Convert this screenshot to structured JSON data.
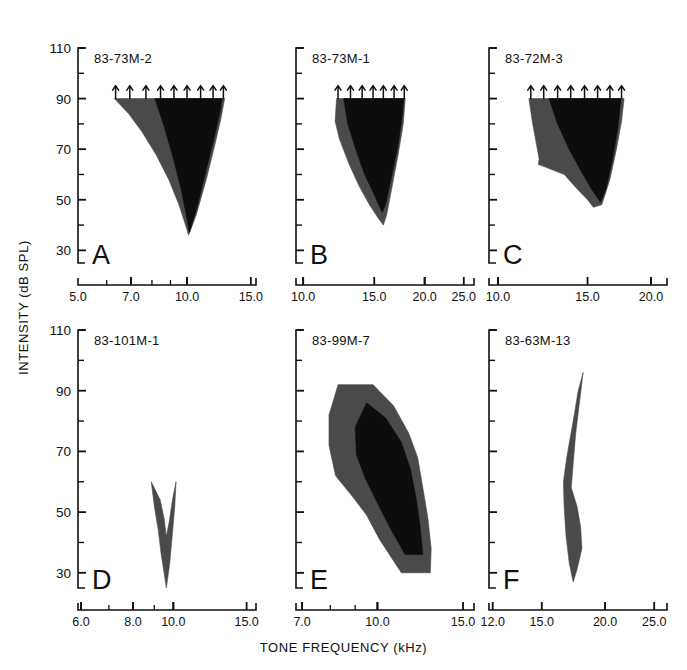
{
  "figure": {
    "axis_titles": {
      "y": "INTENSITY (dB SPL)",
      "x": "TONE FREQUENCY (kHz)"
    },
    "y_tick_labels": [
      "110",
      "90",
      "70",
      "50",
      "30"
    ],
    "y_tick_values": [
      110,
      90,
      70,
      50,
      30
    ],
    "ylim": [
      25,
      110
    ],
    "fill_colors": {
      "outer": "#4a4a4a",
      "inner": "#0d0d0d",
      "axis": "#101010"
    }
  },
  "chart_data": {
    "type": "area",
    "title": "",
    "xlabel": "TONE FREQUENCY (kHz)",
    "ylabel": "INTENSITY (dB SPL)",
    "xscale": "log",
    "ylim": [
      25,
      110
    ],
    "grid": false,
    "legend": "none",
    "panels": [
      {
        "letter": "A",
        "unit_id": "83-73M-2",
        "show_y_labels": true,
        "xlim": [
          5.0,
          15.5
        ],
        "x_tick_labels": [
          "5.0",
          "7.0",
          "10.0",
          "15.0"
        ],
        "x_tick_values": [
          5.0,
          7.0,
          10.0,
          15.0
        ],
        "arrows": {
          "level": 90,
          "frequencies": [
            6.35,
            6.95,
            7.7,
            8.45,
            9.2,
            10.0,
            10.9,
            11.8,
            12.6
          ]
        },
        "outer_curve": [
          [
            6.3,
            90
          ],
          [
            6.9,
            84
          ],
          [
            7.5,
            77
          ],
          [
            8.2,
            68
          ],
          [
            8.9,
            58
          ],
          [
            9.5,
            48
          ],
          [
            9.9,
            40
          ],
          [
            10.1,
            36
          ],
          [
            10.6,
            44
          ],
          [
            11.3,
            58
          ],
          [
            11.9,
            71
          ],
          [
            12.4,
            82
          ],
          [
            12.7,
            90
          ]
        ],
        "inner_curve": [
          [
            8.15,
            90
          ],
          [
            8.6,
            80
          ],
          [
            9.1,
            68
          ],
          [
            9.6,
            55
          ],
          [
            9.95,
            44
          ],
          [
            10.15,
            37
          ],
          [
            10.7,
            48
          ],
          [
            11.3,
            62
          ],
          [
            11.9,
            75
          ],
          [
            12.35,
            85
          ],
          [
            12.5,
            90
          ]
        ]
      },
      {
        "letter": "B",
        "unit_id": "83-73M-1",
        "show_y_labels": false,
        "xlim": [
          9.6,
          26.5
        ],
        "x_tick_labels": [
          "10.0",
          "15.0",
          "20.0",
          "25.0"
        ],
        "x_tick_values": [
          10.0,
          15.0,
          20.0,
          25.0
        ],
        "arrows": {
          "level": 90,
          "frequencies": [
            12.2,
            13.1,
            14.0,
            14.9,
            15.8,
            16.8,
            17.8
          ]
        },
        "outer_curve": [
          [
            12.1,
            90
          ],
          [
            12.0,
            81
          ],
          [
            12.3,
            74
          ],
          [
            13.0,
            64
          ],
          [
            13.8,
            55
          ],
          [
            14.6,
            48
          ],
          [
            15.3,
            43
          ],
          [
            15.8,
            40
          ],
          [
            16.1,
            44
          ],
          [
            16.6,
            55
          ],
          [
            17.2,
            68
          ],
          [
            17.7,
            80
          ],
          [
            17.9,
            90
          ]
        ],
        "inner_curve": [
          [
            12.6,
            90
          ],
          [
            12.9,
            80
          ],
          [
            13.5,
            70
          ],
          [
            14.2,
            60
          ],
          [
            15.0,
            52
          ],
          [
            15.7,
            45
          ],
          [
            16.0,
            48
          ],
          [
            16.6,
            60
          ],
          [
            17.2,
            72
          ],
          [
            17.6,
            83
          ],
          [
            17.75,
            90
          ]
        ]
      },
      {
        "letter": "C",
        "unit_id": "83-72M-3",
        "show_y_labels": false,
        "xlim": [
          9.6,
          21.5
        ],
        "x_tick_labels": [
          "10.0",
          "15.0",
          "20.0"
        ],
        "x_tick_values": [
          10.0,
          15.0,
          20.0
        ],
        "arrows": {
          "level": 90,
          "frequencies": [
            11.6,
            12.3,
            13.1,
            13.9,
            14.8,
            15.7,
            16.6,
            17.5
          ]
        },
        "outer_curve": [
          [
            11.5,
            90
          ],
          [
            11.7,
            80
          ],
          [
            11.9,
            72
          ],
          [
            12.05,
            66
          ],
          [
            12.0,
            64
          ],
          [
            13.5,
            60
          ],
          [
            14.2,
            55
          ],
          [
            15.0,
            50
          ],
          [
            15.4,
            47
          ],
          [
            16.0,
            48
          ],
          [
            16.6,
            58
          ],
          [
            17.1,
            70
          ],
          [
            17.5,
            81
          ],
          [
            17.7,
            90
          ]
        ],
        "inner_curve": [
          [
            12.6,
            90
          ],
          [
            13.1,
            80
          ],
          [
            13.8,
            70
          ],
          [
            14.6,
            61
          ],
          [
            15.3,
            54
          ],
          [
            15.9,
            49
          ],
          [
            16.3,
            54
          ],
          [
            16.8,
            66
          ],
          [
            17.2,
            78
          ],
          [
            17.45,
            90
          ]
        ]
      },
      {
        "letter": "D",
        "unit_id": "83-101M-1",
        "show_y_labels": true,
        "xlim": [
          5.9,
          15.8
        ],
        "x_tick_labels": [
          "6.0",
          "8.0",
          "10.0",
          "15.0"
        ],
        "x_tick_values": [
          6.0,
          8.0,
          10.0,
          15.0
        ],
        "arrows": null,
        "outer_curve": [
          [
            8.85,
            60
          ],
          [
            9.0,
            52
          ],
          [
            9.2,
            44
          ],
          [
            9.35,
            36
          ],
          [
            9.5,
            30
          ],
          [
            9.62,
            25
          ],
          [
            9.8,
            33
          ],
          [
            9.95,
            43
          ],
          [
            10.08,
            52
          ],
          [
            10.15,
            60
          ],
          [
            9.95,
            54
          ],
          [
            9.78,
            47
          ],
          [
            9.62,
            42
          ],
          [
            9.5,
            48
          ],
          [
            9.3,
            54
          ]
        ],
        "inner_curve": null
      },
      {
        "letter": "E",
        "unit_id": "83-99M-7",
        "show_y_labels": false,
        "xlim": [
          6.8,
          15.8
        ],
        "x_tick_labels": [
          "7.0",
          "10.0",
          "15.0"
        ],
        "x_tick_values": [
          7.0,
          10.0,
          15.0
        ],
        "arrows": null,
        "outer_curve": [
          [
            8.3,
            92
          ],
          [
            9.8,
            92
          ],
          [
            10.8,
            85
          ],
          [
            11.6,
            76
          ],
          [
            12.1,
            68
          ],
          [
            12.4,
            58
          ],
          [
            12.7,
            48
          ],
          [
            12.9,
            38
          ],
          [
            12.85,
            30
          ],
          [
            11.2,
            30
          ],
          [
            10.1,
            41
          ],
          [
            9.5,
            49
          ],
          [
            8.9,
            55
          ],
          [
            8.2,
            62
          ],
          [
            7.95,
            72
          ],
          [
            7.95,
            82
          ]
        ],
        "inner_curve": [
          [
            9.5,
            86
          ],
          [
            10.4,
            81
          ],
          [
            11.2,
            73
          ],
          [
            11.7,
            64
          ],
          [
            12.0,
            55
          ],
          [
            12.25,
            45
          ],
          [
            12.4,
            36
          ],
          [
            11.4,
            36
          ],
          [
            10.6,
            45
          ],
          [
            10.0,
            53
          ],
          [
            9.45,
            61
          ],
          [
            9.05,
            69
          ],
          [
            9.0,
            78
          ]
        ]
      },
      {
        "letter": "F",
        "unit_id": "83-63M-13",
        "show_y_labels": false,
        "xlim": [
          11.8,
          26.5
        ],
        "x_tick_labels": [
          "12.0",
          "15.0",
          "20.0",
          "25.0"
        ],
        "x_tick_values": [
          12.0,
          15.0,
          20.0,
          25.0
        ],
        "arrows": null,
        "outer_curve": [
          [
            18.1,
            96
          ],
          [
            17.8,
            86
          ],
          [
            17.5,
            76
          ],
          [
            17.3,
            66
          ],
          [
            17.15,
            58
          ],
          [
            17.6,
            52
          ],
          [
            17.9,
            45
          ],
          [
            18.0,
            38
          ],
          [
            17.6,
            31
          ],
          [
            17.3,
            27
          ],
          [
            17.0,
            33
          ],
          [
            16.75,
            42
          ],
          [
            16.6,
            52
          ],
          [
            16.55,
            60
          ],
          [
            16.8,
            68
          ],
          [
            17.3,
            80
          ],
          [
            17.7,
            90
          ]
        ],
        "inner_curve": null
      }
    ]
  }
}
